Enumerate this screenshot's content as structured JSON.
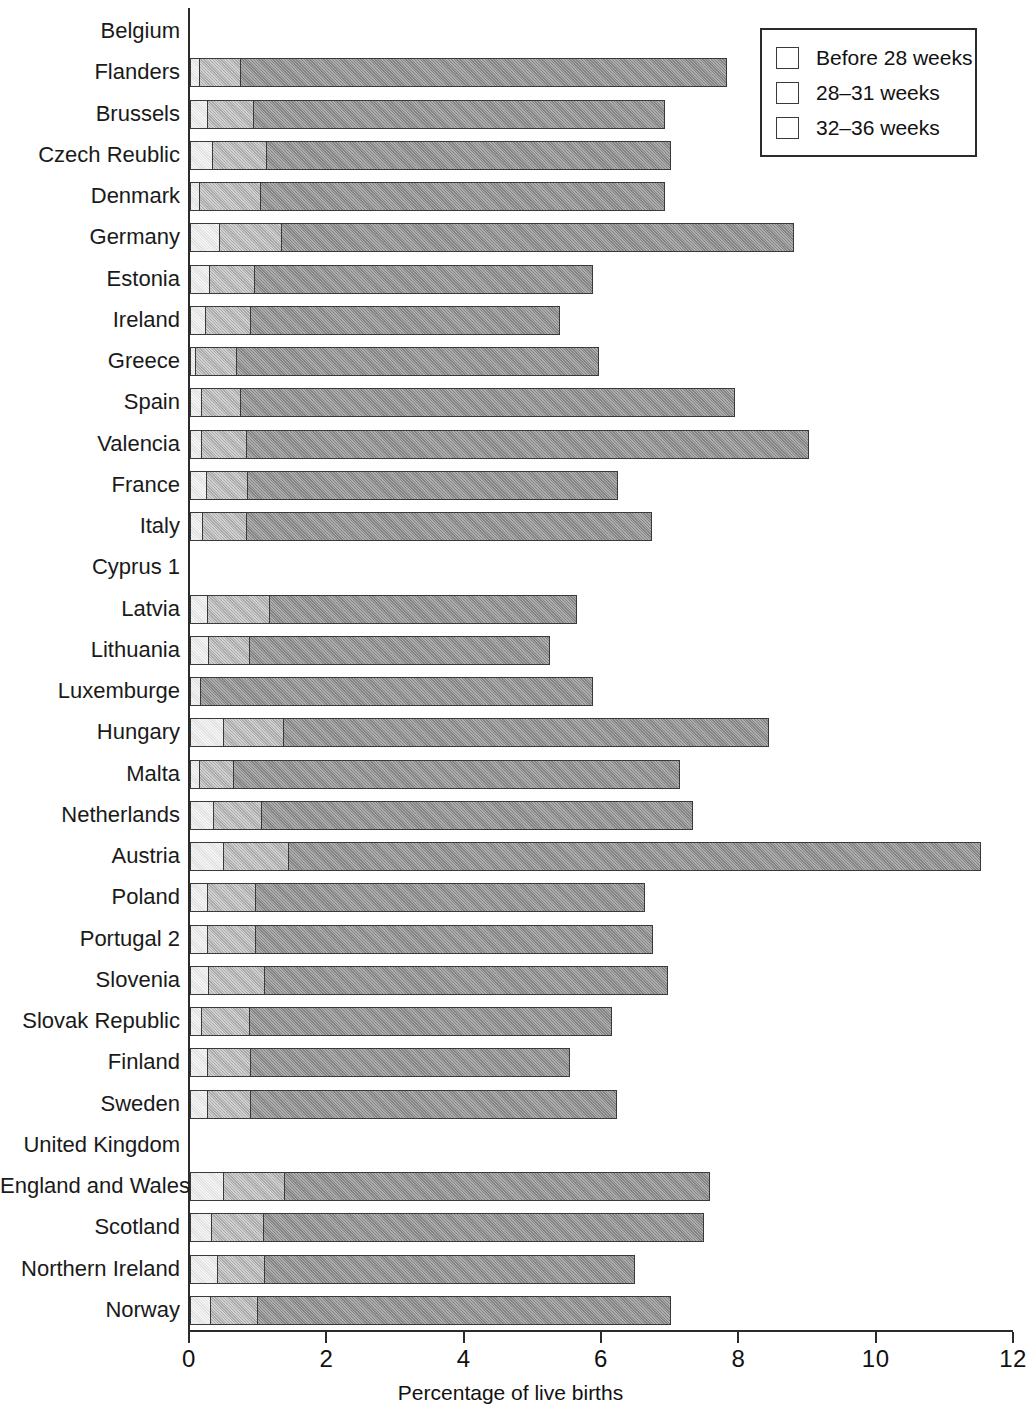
{
  "chart_data": {
    "type": "bar",
    "subtype": "horizontal-stacked",
    "title": "",
    "xlabel": "Percentage of live births",
    "ylabel": "",
    "xlim": [
      0,
      12
    ],
    "xticks": [
      0,
      2,
      4,
      6,
      8,
      10,
      12
    ],
    "xtick_labels": [
      "0",
      "2",
      "4",
      "6",
      "8",
      "10",
      "12"
    ],
    "grid": false,
    "legend_position": "top-right",
    "legend": [
      "Before 28 weeks",
      "28–31 weeks",
      "32–36 weeks"
    ],
    "categories": [
      "Belgium",
      "Flanders",
      "Brussels",
      "Czech Reublic",
      "Denmark",
      "Germany",
      "Estonia",
      "Ireland",
      "Greece",
      "Spain",
      "Valencia",
      "France",
      "Italy",
      "Cyprus 1",
      "Latvia",
      "Lithuania",
      "Luxemburge",
      "Hungary",
      "Malta",
      "Netherlands",
      "Austria",
      "Poland",
      "Portugal 2",
      "Slovenia",
      "Slovak Republic",
      "Finland",
      "Sweden",
      "United Kingdom",
      "England and Wales 3",
      "Scotland",
      "Northern Ireland",
      "Norway"
    ],
    "series": [
      {
        "name": "Before 28 weeks",
        "color": "#e6e6e6",
        "values": [
          null,
          0.15,
          0.27,
          0.35,
          0.15,
          0.45,
          0.3,
          0.24,
          0.1,
          0.18,
          0.18,
          0.25,
          0.2,
          null,
          0.27,
          0.29,
          0.17,
          0.5,
          0.15,
          0.36,
          0.5,
          0.27,
          0.27,
          0.29,
          0.18,
          0.27,
          0.27,
          null,
          0.5,
          0.33,
          0.42,
          0.31
        ]
      },
      {
        "name": "28–31 weeks",
        "color": "#b3b3b3",
        "values": [
          null,
          0.62,
          0.69,
          0.8,
          0.91,
          0.92,
          0.68,
          0.68,
          0.62,
          0.6,
          0.68,
          0.62,
          0.66,
          null,
          0.92,
          0.61,
          0.01,
          0.9,
          0.52,
          0.72,
          0.97,
          0.73,
          0.73,
          0.83,
          0.72,
          0.65,
          0.65,
          null,
          0.91,
          0.78,
          0.7,
          0.71
        ]
      },
      {
        "name": "32–36 weeks",
        "color": "#8e8e8e",
        "values": [
          null,
          7.09,
          6.0,
          5.9,
          5.9,
          7.47,
          4.93,
          4.51,
          5.28,
          7.2,
          8.2,
          5.41,
          5.91,
          null,
          4.49,
          4.39,
          5.72,
          7.08,
          6.51,
          6.29,
          10.09,
          5.68,
          5.79,
          5.89,
          5.29,
          4.66,
          5.35,
          null,
          6.21,
          6.42,
          5.4,
          6.03
        ]
      }
    ],
    "totals": [
      null,
      7.86,
      6.96,
      7.05,
      6.96,
      8.84,
      5.91,
      5.43,
      6.0,
      7.98,
      9.06,
      6.28,
      6.77,
      null,
      5.68,
      5.29,
      5.9,
      8.48,
      7.18,
      7.37,
      11.56,
      6.68,
      6.79,
      7.01,
      6.19,
      5.58,
      6.27,
      null,
      7.62,
      7.53,
      6.52,
      7.05
    ]
  },
  "icons": {
    "swatch_before_28": "legend-swatch-light",
    "swatch_28_31": "legend-swatch-medium",
    "swatch_32_36": "legend-swatch-dark"
  }
}
